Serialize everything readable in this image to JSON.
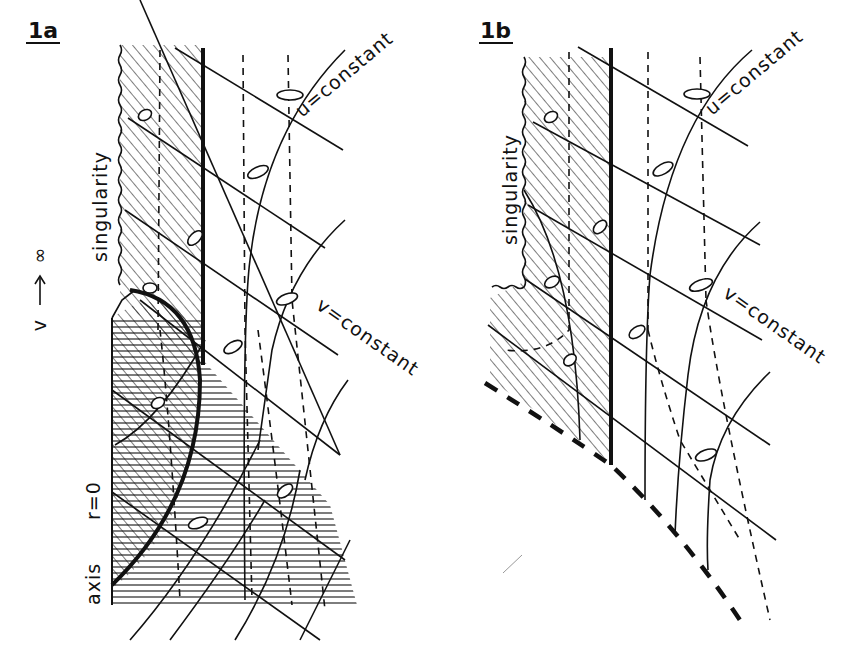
{
  "figure": {
    "panels": [
      {
        "id": "1a",
        "title": "1a",
        "labels": {
          "singularity": "singularity",
          "u_constant": "u=constant",
          "v_constant": "v=constant",
          "axis": "axis",
          "r_zero": "r=0"
        },
        "side_arrow": {
          "from": "v",
          "to": "∞",
          "arrow": "↑"
        }
      },
      {
        "id": "1b",
        "title": "1b",
        "labels": {
          "singularity": "singularity",
          "u_constant": "u=constant",
          "v_constant": "v=constant"
        }
      }
    ],
    "colors": {
      "ink": "#111111",
      "paper": "#ffffff"
    }
  }
}
